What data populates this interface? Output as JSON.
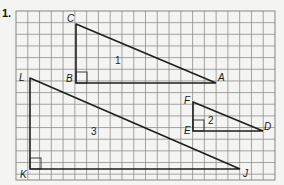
{
  "problem": {
    "number": "1."
  },
  "grid": {
    "left": 16,
    "top": 11,
    "right": 275,
    "bottom": 180,
    "cols": 22,
    "rows": 14.5,
    "line_color": "#8e8e8e"
  },
  "triangles": [
    {
      "label": "1",
      "label_pos": [
        115,
        64
      ],
      "vertices": {
        "C": {
          "label": "C",
          "point": [
            76,
            24
          ],
          "label_pos": [
            67,
            22
          ]
        },
        "B": {
          "label": "B",
          "point": [
            76,
            83
          ],
          "label_pos": [
            66,
            82
          ]
        },
        "A": {
          "label": "A",
          "point": [
            216,
            83
          ],
          "label_pos": [
            218,
            81
          ]
        }
      },
      "right_angle_at": "B"
    },
    {
      "label": "2",
      "label_pos": [
        208,
        124
      ],
      "vertices": {
        "F": {
          "label": "F",
          "point": [
            193,
            102
          ],
          "label_pos": [
            184,
            104
          ]
        },
        "E": {
          "label": "E",
          "point": [
            193,
            131
          ],
          "label_pos": [
            184,
            134
          ]
        },
        "D": {
          "label": "D",
          "point": [
            263,
            131
          ],
          "label_pos": [
            264,
            130
          ]
        }
      },
      "right_angle_at": "E"
    },
    {
      "label": "3",
      "label_pos": [
        91,
        135
      ],
      "vertices": {
        "L": {
          "label": "L",
          "point": [
            30,
            78
          ],
          "label_pos": [
            19,
            81
          ]
        },
        "K": {
          "label": "K",
          "point": [
            30,
            169
          ],
          "label_pos": [
            20,
            178
          ]
        },
        "J": {
          "label": "J",
          "point": [
            240,
            169
          ],
          "label_pos": [
            243,
            177
          ]
        }
      },
      "right_angle_at": "K"
    }
  ],
  "colors": {
    "background": "#f4f4f2",
    "stroke": "#1e1e1e",
    "grid": "#8e8e8e"
  }
}
